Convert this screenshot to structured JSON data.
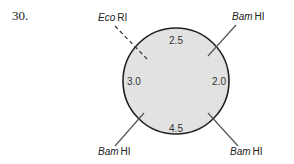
{
  "problem": {
    "number": "30."
  },
  "map": {
    "circle_fill": "#e2e2e2",
    "circle_stroke": "#222222",
    "segments": [
      {
        "label": "2.5",
        "position": "top"
      },
      {
        "label": "2.0",
        "position": "right"
      },
      {
        "label": "4.5",
        "position": "bottom"
      },
      {
        "label": "3.0",
        "position": "left"
      }
    ],
    "sites": [
      {
        "enzyme_italic": "Eco",
        "enzyme_rest": "RI",
        "position": "top-left",
        "line": "dashed"
      },
      {
        "enzyme_italic": "Bam",
        "enzyme_rest": "HI",
        "position": "top-right",
        "line": "solid"
      },
      {
        "enzyme_italic": "Bam",
        "enzyme_rest": "HI",
        "position": "bottom-right",
        "line": "solid"
      },
      {
        "enzyme_italic": "Bam",
        "enzyme_rest": "HI",
        "position": "bottom-left",
        "line": "solid"
      }
    ]
  }
}
